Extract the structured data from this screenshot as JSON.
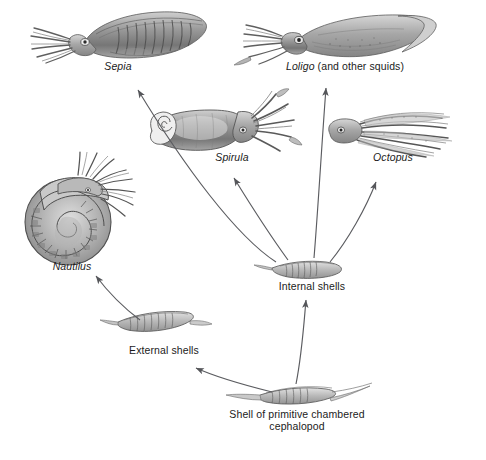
{
  "figure": {
    "background_color": "#ffffff",
    "ink_color": "#4a4a4a",
    "text_color": "#1b1b1b",
    "width": 486,
    "height": 460
  },
  "nodes": {
    "sepia": {
      "label": "Sepia",
      "kind": "genus",
      "icon": "cuttlefish-illustration",
      "x": 118,
      "y": 66
    },
    "loligo": {
      "label": "Loligo",
      "suffix": " (and other squids)",
      "kind": "genus",
      "icon": "squid-illustration",
      "x": 345,
      "y": 66
    },
    "spirula": {
      "label": "Spirula",
      "kind": "genus",
      "icon": "spirula-illustration",
      "x": 232,
      "y": 157
    },
    "octopus": {
      "label": "Octopus",
      "kind": "genus",
      "icon": "octopus-illustration",
      "x": 393,
      "y": 157
    },
    "nautilus": {
      "label": "Nautilus",
      "kind": "genus",
      "icon": "nautilus-shell-illustration",
      "x": 72,
      "y": 266
    },
    "internal_shells": {
      "label": "Internal shells",
      "kind": "stage",
      "icon": "internal-shell-illustration",
      "x": 312,
      "y": 286
    },
    "external_shells": {
      "label": "External shells",
      "kind": "stage",
      "icon": "external-shell-illustration",
      "x": 164,
      "y": 350
    },
    "primitive_shell": {
      "label": "Shell of primitive chambered\ncephalopod",
      "kind": "root",
      "icon": "primitive-chambered-shell-illustration",
      "x": 297,
      "y": 414
    }
  },
  "arrows": [
    {
      "name": "primitive-to-external",
      "from": "primitive_shell",
      "to": "external_shells"
    },
    {
      "name": "primitive-to-internal",
      "from": "primitive_shell",
      "to": "internal_shells"
    },
    {
      "name": "external-to-nautilus",
      "from": "external_shells",
      "to": "nautilus"
    },
    {
      "name": "internal-to-sepia",
      "from": "internal_shells",
      "to": "sepia"
    },
    {
      "name": "internal-to-spirula",
      "from": "internal_shells",
      "to": "spirula"
    },
    {
      "name": "internal-to-loligo",
      "from": "internal_shells",
      "to": "loligo"
    },
    {
      "name": "internal-to-octopus",
      "from": "internal_shells",
      "to": "octopus"
    }
  ]
}
